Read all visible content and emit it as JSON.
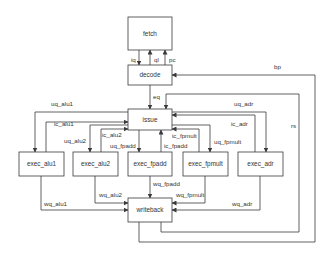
{
  "diagram": {
    "type": "processor-pipeline-block-diagram",
    "nodes": [
      {
        "id": "fetch",
        "label": "fetch"
      },
      {
        "id": "decode",
        "label": "decode"
      },
      {
        "id": "issue",
        "label": "issue"
      },
      {
        "id": "exec_alu1",
        "label": "exec_alu1"
      },
      {
        "id": "exec_alu2",
        "label": "exec_alu2"
      },
      {
        "id": "exec_fpadd",
        "label": "exec_fpadd"
      },
      {
        "id": "exec_fpmult",
        "label": "exec_fpmult"
      },
      {
        "id": "exec_adr",
        "label": "exec_adr"
      },
      {
        "id": "writeback",
        "label": "writeback"
      }
    ],
    "edges": [
      {
        "label": "iq",
        "from": "fetch",
        "to": "decode"
      },
      {
        "label": "ql",
        "from": "decode",
        "to": "fetch"
      },
      {
        "label": "pc",
        "from": "decode",
        "to": "fetch"
      },
      {
        "label": "eq",
        "from": "decode",
        "to": "issue"
      },
      {
        "label": "uq_alu1",
        "from": "issue",
        "to": "exec_alu1"
      },
      {
        "label": "ic_alu1",
        "from": "exec_alu1",
        "to": "issue"
      },
      {
        "label": "uq_alu2",
        "from": "issue",
        "to": "exec_alu2"
      },
      {
        "label": "ic_alu2",
        "from": "exec_alu2",
        "to": "issue"
      },
      {
        "label": "uq_fpadd",
        "from": "issue",
        "to": "exec_fpadd"
      },
      {
        "label": "ic_fpadd",
        "from": "exec_fpadd",
        "to": "issue"
      },
      {
        "label": "uq_fpmult",
        "from": "issue",
        "to": "exec_fpmult"
      },
      {
        "label": "ic_fpmult",
        "from": "exec_fpmult",
        "to": "issue"
      },
      {
        "label": "uq_adr",
        "from": "issue",
        "to": "exec_adr"
      },
      {
        "label": "ic_adr",
        "from": "exec_adr",
        "to": "issue"
      },
      {
        "label": "wq_alu1",
        "from": "exec_alu1",
        "to": "writeback"
      },
      {
        "label": "wq_alu2",
        "from": "exec_alu2",
        "to": "writeback"
      },
      {
        "label": "wq_fpadd",
        "from": "exec_fpadd",
        "to": "writeback"
      },
      {
        "label": "wq_fpmult",
        "from": "exec_fpmult",
        "to": "writeback"
      },
      {
        "label": "wq_adr",
        "from": "exec_adr",
        "to": "writeback"
      },
      {
        "label": "rs",
        "from": "writeback",
        "to": "issue"
      },
      {
        "label": "bp",
        "from": "writeback",
        "to": "decode"
      }
    ]
  },
  "labels": {
    "fetch": "fetch",
    "decode": "decode",
    "issue": "issue",
    "exec_alu1": "exec_alu1",
    "exec_alu2": "exec_alu2",
    "exec_fpadd": "exec_fpadd",
    "exec_fpmult": "exec_fpmult",
    "exec_adr": "exec_adr",
    "writeback": "writeback",
    "iq": "iq",
    "ql": "ql",
    "pc": "pc",
    "eq": "eq",
    "uq_alu1": "uq_alu1",
    "ic_alu1": "ic_alu1",
    "uq_alu2": "uq_alu2",
    "ic_alu2": "ic_alu2",
    "uq_fpadd": "uq_fpadd",
    "ic_fpadd": "ic_fpadd",
    "uq_fpmult": "uq_fpmult",
    "ic_fpmult": "ic_fpmult",
    "uq_adr": "uq_adr",
    "ic_adr": "ic_adr",
    "wq_alu1": "wq_alu1",
    "wq_alu2": "wq_alu2",
    "wq_fpadd": "wq_fpadd",
    "wq_fpmult": "wq_fpmult",
    "wq_adr": "wq_adr",
    "rs": "rs",
    "bp": "bp"
  },
  "colors": {
    "line": "#3a3a3a",
    "text": "#333333",
    "background": "#ffffff"
  }
}
